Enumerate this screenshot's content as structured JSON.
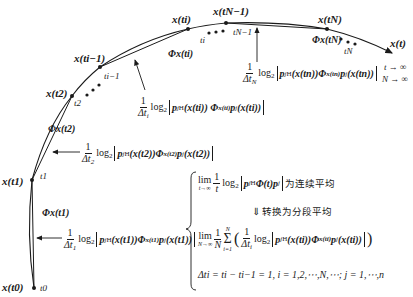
{
  "diagram": {
    "type": "trajectory-segmentation",
    "curve_label": "x(t)",
    "limits": [
      "t → ∞",
      "N → ∞"
    ],
    "points": [
      {
        "id": "t0",
        "state_label": "x(t0)",
        "time_label": "t0"
      },
      {
        "id": "t1",
        "state_label": "x(t1)",
        "time_label": "t1"
      },
      {
        "id": "t2",
        "state_label": "x(t2)",
        "time_label": "t2"
      },
      {
        "id": "ti-1",
        "state_label": "x(ti−1)",
        "time_label": "ti−1"
      },
      {
        "id": "ti",
        "state_label": "x(ti)",
        "time_label": "ti"
      },
      {
        "id": "tN-1",
        "state_label": "x(tN−1)",
        "time_label": "tN−1"
      },
      {
        "id": "tN",
        "state_label": "x(tN)",
        "time_label": "tN"
      }
    ],
    "segment_labels": [
      {
        "id": "phi-t1",
        "text": "Φx(t1)"
      },
      {
        "id": "phi-t2",
        "text": "Φx(t2)"
      },
      {
        "id": "phi-ti",
        "text": "Φx(ti)"
      },
      {
        "id": "phi-tN",
        "text": "Φx(tN)"
      }
    ],
    "annotations": {
      "seg1": {
        "frac_num": "1",
        "frac_den": "Δt",
        "frac_den_sub": "1",
        "log": "log",
        "log_sub": "2",
        "body_p": "p",
        "body_sub": "j",
        "body_sup": "H",
        "arg": "(x(t1))",
        "phi": "Φ",
        "phi_sub": "x(t1)",
        "tail": "p",
        "tail_sub": "j",
        "tail_arg": "(x(t1))"
      },
      "seg2": {
        "frac_num": "1",
        "frac_den": "Δt",
        "frac_den_sub": "2",
        "log": "log",
        "log_sub": "2",
        "body_p": "p",
        "body_sub": "j",
        "body_sup": "H",
        "arg": "(x(t2))",
        "phi": "Φ",
        "phi_sub": "x(t2)",
        "tail": "p",
        "tail_sub": "j",
        "tail_arg": "(x(t2))"
      },
      "segi": {
        "frac_num": "1",
        "frac_den": "Δt",
        "frac_den_sub": "i",
        "log": "log",
        "log_sub": "2",
        "body_p": "p",
        "body_sub": "j",
        "body_sup": "H",
        "arg": "(x(ti))",
        "phi": "Φ",
        "phi_sub": "x(ti)",
        "tail": "p",
        "tail_sub": "j",
        "tail_arg": "(x(ti))"
      },
      "segN": {
        "frac_num": "1",
        "frac_den": "Δt",
        "frac_den_sub": "N",
        "log": "log",
        "log_sub": "2",
        "body_p": "p",
        "body_sub": "j",
        "body_sup": "H",
        "arg": "(x(tn))",
        "phi": "Φ",
        "phi_sub": "x(tn)",
        "tail": "p",
        "tail_sub": "j",
        "tail_arg": "(x(tn))"
      }
    },
    "ellipsis": "• • •",
    "summary_box": {
      "line1_lim": "lim",
      "line1_lim_under": "t→∞",
      "line1_frac_num": "1",
      "line1_frac_den": "t",
      "line1_log": "log",
      "line1_log_sub": "2",
      "line1_body": "p",
      "line1_body_sub": "j",
      "line1_body_sup": "H",
      "line1_phi": "Φ(t)",
      "line1_tail": "p",
      "line1_tail_sub": "j",
      "line1_text": "为连续平均",
      "line2_arrow": "⇓",
      "line2_text": "转换为分段平均",
      "line3_lim": "lim",
      "line3_lim_under": "N→∞",
      "line3_frac_num": "1",
      "line3_frac_den": "N",
      "line3_sum": "Σ",
      "line3_sum_top": "N",
      "line3_sum_bottom": "i=1",
      "line3_inner_num": "1",
      "line3_inner_den": "Δt",
      "line3_inner_den_sub": "i",
      "line3_log": "log",
      "line3_log_sub": "2",
      "line3_body": "p",
      "line3_body_sub": "j",
      "line3_body_sup": "H",
      "line3_arg": "(x(ti))",
      "line3_phi": "Φ",
      "line3_phi_sub": "x(ti)",
      "line3_tail": "p",
      "line3_tail_sub": "j",
      "line3_tail_arg": "(x(ti))",
      "line4": "Δti = ti − ti−1 = 1, i = 1,2,⋯,N,⋯; j = 1,⋯,n"
    }
  }
}
